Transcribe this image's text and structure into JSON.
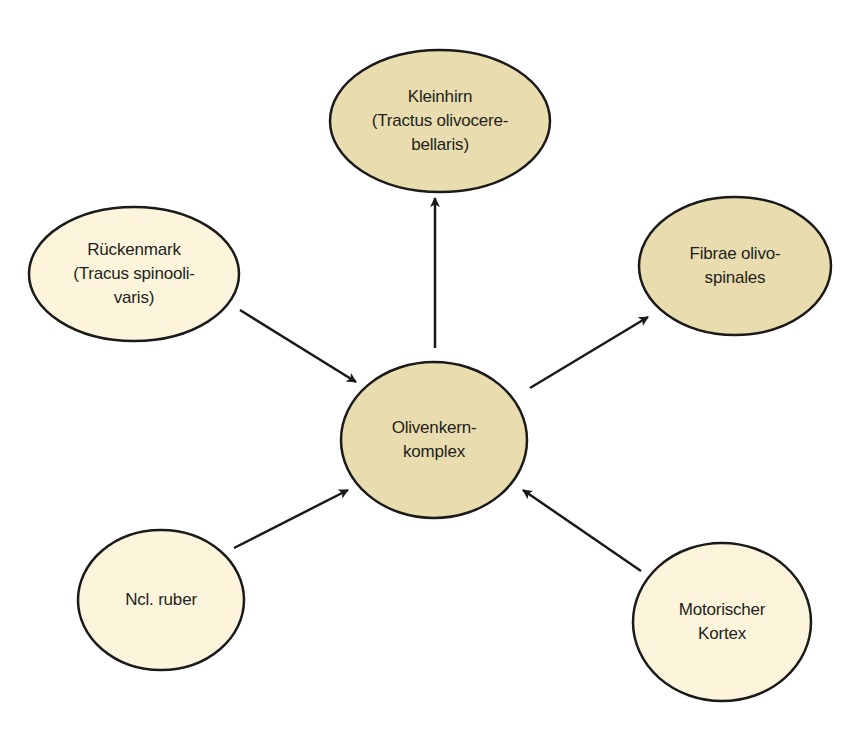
{
  "colors": {
    "efferent_fill": "#e9dcae",
    "afferent_fill": "#fcf5dc",
    "stroke": "#1a1a1a",
    "arrow": "#1a1a1a",
    "text": "#231f20"
  },
  "nodes": {
    "center": {
      "lines": [
        "Olivenkern-",
        "komplex"
      ],
      "cx": 434,
      "cy": 440,
      "rx": 93,
      "ry": 78,
      "kind": "efferent"
    },
    "kleinhirn": {
      "lines": [
        "Kleinhirn",
        "(Tractus olivocere-",
        "bellaris)"
      ],
      "cx": 440,
      "cy": 121,
      "rx": 110,
      "ry": 71,
      "kind": "efferent"
    },
    "fibrae": {
      "lines": [
        "Fibrae olivo-",
        "spinales"
      ],
      "cx": 735,
      "cy": 266,
      "rx": 96,
      "ry": 69,
      "kind": "efferent"
    },
    "rueckenmark": {
      "lines": [
        "Rückenmark",
        "(Tracus spinooli-",
        "varis)"
      ],
      "cx": 134,
      "cy": 274,
      "rx": 105,
      "ry": 67,
      "kind": "afferent"
    },
    "ncl_ruber": {
      "lines": [
        "Ncl. ruber"
      ],
      "cx": 161,
      "cy": 600,
      "rx": 83,
      "ry": 70,
      "kind": "afferent"
    },
    "motorischer_kortex": {
      "lines": [
        "Motorischer",
        "Kortex"
      ],
      "cx": 722,
      "cy": 622,
      "rx": 89,
      "ry": 79,
      "kind": "afferent"
    }
  },
  "edges": [
    {
      "from": "rueckenmark",
      "to": "center",
      "x1": 240,
      "y1": 310,
      "x2": 356,
      "y2": 382
    },
    {
      "from": "center",
      "to": "kleinhirn",
      "x1": 435,
      "y1": 348,
      "x2": 435,
      "y2": 198
    },
    {
      "from": "center",
      "to": "fibrae",
      "x1": 530,
      "y1": 388,
      "x2": 648,
      "y2": 317
    },
    {
      "from": "ncl_ruber",
      "to": "center",
      "x1": 234,
      "y1": 548,
      "x2": 348,
      "y2": 490
    },
    {
      "from": "motorischer_kortex",
      "to": "center",
      "x1": 641,
      "y1": 571,
      "x2": 523,
      "y2": 490
    }
  ]
}
